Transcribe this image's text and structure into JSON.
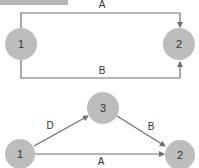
{
  "colors": {
    "node_fill": "#bdbdbd",
    "edge": "#6e6e6e",
    "header_bar": "#b5b5b5",
    "text": "#333333"
  },
  "diagram_top": {
    "nodes": [
      {
        "id": "1",
        "label": "1"
      },
      {
        "id": "2",
        "label": "2"
      }
    ],
    "edges": [
      {
        "from": "1",
        "to": "2",
        "label": "A",
        "route": "over-top"
      },
      {
        "from": "1",
        "to": "2",
        "label": "B",
        "route": "under-bottom"
      }
    ]
  },
  "diagram_bottom": {
    "nodes": [
      {
        "id": "1",
        "label": "1"
      },
      {
        "id": "3",
        "label": "3"
      },
      {
        "id": "2",
        "label": "2"
      }
    ],
    "edges": [
      {
        "from": "1",
        "to": "3",
        "label": "D"
      },
      {
        "from": "3",
        "to": "2",
        "label": "B"
      },
      {
        "from": "1",
        "to": "2",
        "label": "A"
      }
    ]
  }
}
